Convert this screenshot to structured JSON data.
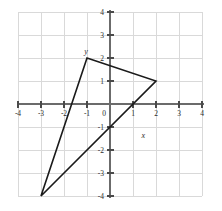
{
  "chart_data": {
    "type": "scatter",
    "title": "",
    "subtitle": "",
    "xlabel": "x",
    "ylabel": "y",
    "xlim": [
      -4,
      4
    ],
    "ylim": [
      -4,
      4
    ],
    "grid": true,
    "legend": null,
    "x_tick_labels": [
      "-4",
      "-3",
      "-2",
      "-1",
      "0",
      "1",
      "2",
      "3",
      "4"
    ],
    "x_tick_values": [
      -4,
      -3,
      -2,
      -1,
      0,
      1,
      2,
      3,
      4
    ],
    "y_tick_labels": [
      "4",
      "3",
      "2",
      "1",
      "0",
      "-1",
      "-2",
      "-3",
      "-4"
    ],
    "y_tick_values": [
      4,
      3,
      2,
      1,
      0,
      -1,
      -2,
      -3,
      -4
    ],
    "shapes": [
      {
        "name": "triangle",
        "kind": "polygon",
        "closed": true,
        "stroke": "#1a1a1a",
        "fill": "none",
        "points": [
          {
            "x": -1,
            "y": 2
          },
          {
            "x": 2,
            "y": 1
          },
          {
            "x": -3,
            "y": -4
          }
        ]
      }
    ],
    "annotations": [
      {
        "text": "y",
        "x": -1,
        "y": 2,
        "role": "vertex-label"
      },
      {
        "text": "x",
        "x": 1.45,
        "y": -1.35,
        "role": "axis-label"
      }
    ],
    "colors": {
      "grid": "#d9d9d9",
      "axis": "#6b6b6b",
      "polygon": "#1a1a1a",
      "text": "#2b2b2b",
      "background": "#ffffff"
    }
  },
  "geometry": {
    "origin_px": {
      "x": 110,
      "y": 104
    },
    "unit_px": 23,
    "plot_left_px": 18,
    "plot_right_px": 202,
    "plot_top_px": 12,
    "plot_bottom_px": 196
  },
  "axis": {
    "x_label": "x",
    "y_label": "y",
    "x_ticks": [
      "-4",
      "-3",
      "-2",
      "-1",
      "0",
      "1",
      "2",
      "3",
      "4"
    ],
    "y_ticks": [
      "4",
      "3",
      "2",
      "1",
      "0",
      "-1",
      "-2",
      "-3",
      "-4"
    ]
  },
  "vertices": {
    "top": {
      "label": "y",
      "x": "-1",
      "y": "2"
    },
    "right": {
      "label": "",
      "x": "2",
      "y": "1"
    },
    "bottom": {
      "label": "",
      "x": "-3",
      "y": "-4"
    }
  }
}
